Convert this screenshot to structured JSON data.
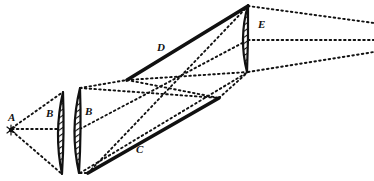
{
  "figure": {
    "type": "optical-ray-diagram",
    "background_color": "#ffffff",
    "ink_color": "#111111",
    "width": 374,
    "height": 181
  },
  "labels": [
    {
      "id": "A",
      "text": "A",
      "x": 8,
      "y": 112,
      "size": 11,
      "name": "label-a-source"
    },
    {
      "id": "B1",
      "text": "B",
      "x": 46,
      "y": 108,
      "size": 11,
      "name": "label-b-left-lens"
    },
    {
      "id": "B2",
      "text": "B",
      "x": 85,
      "y": 106,
      "size": 11,
      "name": "label-b-right-lens"
    },
    {
      "id": "C",
      "text": "C",
      "x": 136,
      "y": 144,
      "size": 11,
      "name": "label-c-lower-edge"
    },
    {
      "id": "D",
      "text": "D",
      "x": 157,
      "y": 42,
      "size": 11,
      "name": "label-d-upper-edge"
    },
    {
      "id": "E",
      "text": "E",
      "x": 258,
      "y": 19,
      "size": 11,
      "name": "label-e-lens"
    }
  ],
  "source_marker": {
    "name": "source-point-a",
    "x": 11,
    "y": 130,
    "radius": 2.2
  },
  "lenses": [
    {
      "id": "B-left",
      "name": "lens-b-left",
      "type": "biconvex",
      "top_x": 63,
      "top_y": 92,
      "bottom_x": 62,
      "bottom_y": 174,
      "left_bulge": 9,
      "right_bulge": 2,
      "hatch": true
    },
    {
      "id": "B-right",
      "name": "lens-b-right",
      "type": "biconvex",
      "top_x": 80,
      "top_y": 88,
      "bottom_x": 79,
      "bottom_y": 173,
      "left_bulge": 10,
      "right_bulge": 2,
      "hatch": true
    },
    {
      "id": "E",
      "name": "lens-e",
      "type": "plano-convex",
      "top_x": 248,
      "top_y": 5,
      "bottom_x": 247,
      "bottom_y": 72,
      "left_bulge": 9,
      "right_bulge": 1,
      "hatch": true
    }
  ],
  "thick_edges": [
    {
      "id": "D",
      "name": "beam-edge-upper-d",
      "points": "127,80 248,6",
      "width": 3.6
    },
    {
      "id": "C",
      "name": "beam-edge-lower-c",
      "points": "88,173 219,98",
      "width": 3.6
    }
  ],
  "dotted_rays": {
    "left_fan": [
      {
        "name": "ray-a-upper",
        "points": "12,128 63,92"
      },
      {
        "name": "ray-a-axis",
        "points": "12,129 63,129"
      },
      {
        "name": "ray-a-lower",
        "points": "12,131 62,174"
      }
    ],
    "beam_outline": [
      {
        "name": "ray-upper-b-to-d",
        "points": "80,88 127,80"
      },
      {
        "name": "ray-upper-d-to-e",
        "points": "127,80 248,72"
      },
      {
        "name": "ray-lower-b-to-c",
        "points": "80,173 88,173"
      },
      {
        "name": "ray-lower-c-to-e",
        "points": "219,98 248,72"
      },
      {
        "name": "ray-axis-b-to-e",
        "points": "80,129 248,40"
      }
    ],
    "cross_diagonals": [
      {
        "name": "ray-cross-lower-left-to-upper-right",
        "points": "88,173 248,6"
      },
      {
        "name": "ray-cross-upper-left-to-lower-right",
        "points": "127,80 219,98"
      },
      {
        "name": "ray-cross-b-top-to-c",
        "points": "80,88 219,98"
      },
      {
        "name": "ray-cross-b-bottom-to-d",
        "points": "80,173 248,72"
      }
    ],
    "right_fan": [
      {
        "name": "ray-out-upper",
        "points": "248,6 374,23"
      },
      {
        "name": "ray-out-axis",
        "points": "248,40 374,40"
      },
      {
        "name": "ray-out-lower",
        "points": "248,72 374,52"
      }
    ]
  }
}
